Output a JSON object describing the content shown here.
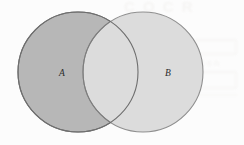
{
  "figure": {
    "type": "venn-diagram",
    "caption": "",
    "background_color": "#fcfcfc",
    "width": 244,
    "height": 145
  },
  "sets": [
    {
      "id": "A",
      "label": "A",
      "label_x": 62,
      "label_y": 76,
      "center_x": 78,
      "center_y": 72,
      "radius": 60,
      "fill_color": "#b7b7b7",
      "stroke_color": "#6e6e6e",
      "position": "left"
    },
    {
      "id": "B",
      "label": "B",
      "label_x": 168,
      "label_y": 76,
      "center_x": 143,
      "center_y": 72,
      "radius": 60,
      "fill_color": "#dcdcdc",
      "stroke_color": "#8f8f8f",
      "position": "right"
    }
  ],
  "intersection": {
    "label": "",
    "fill_color": "#dcdcdc",
    "stroke_color": "#7d7d7d",
    "cusp_top_y": 22,
    "cusp_bottom_y": 122,
    "left_x": 108,
    "right_x": 150
  },
  "artifacts": {
    "visible": true,
    "description": "faint scanned bleed-through marks",
    "top_text": "C O   C R",
    "right_text": "ion",
    "color": "#f0eeec"
  }
}
